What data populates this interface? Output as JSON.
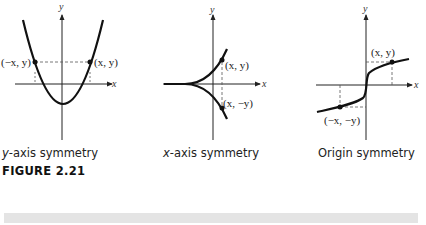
{
  "figure": {
    "label": "FIGURE 2.21",
    "panels": [
      {
        "id": "y-axis-symmetry",
        "caption_var": "y",
        "caption_rest": "-axis symmetry",
        "axis_x_label": "x",
        "axis_y_label": "y",
        "point_labels": [
          "(−x, y)",
          "(x, y)"
        ]
      },
      {
        "id": "x-axis-symmetry",
        "caption_var": "x",
        "caption_rest": "-axis symmetry",
        "axis_x_label": "x",
        "axis_y_label": "y",
        "point_labels": [
          "(x, y)",
          "(x, −y)"
        ]
      },
      {
        "id": "origin-symmetry",
        "caption_var": "",
        "caption_rest": "Origin symmetry",
        "axis_x_label": "x",
        "axis_y_label": "y",
        "point_labels": [
          "(x, y)",
          "(−x, −y)"
        ]
      }
    ]
  },
  "colors": {
    "curve": "#111111",
    "axis": "#222222",
    "dashed": "#555555",
    "bar": "#e4e4e4"
  }
}
